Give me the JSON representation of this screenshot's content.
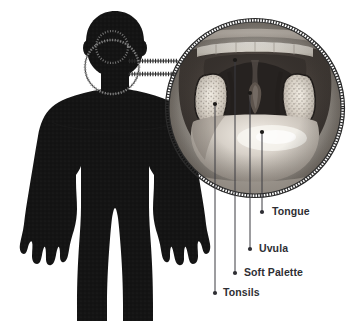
{
  "figure": {
    "body_silhouette": {
      "name": "human-body-silhouette",
      "color": "#141414",
      "description": "Front-facing dark silhouette of a human upper body, cropped at the thighs"
    },
    "magnifier": {
      "small_circle_name": "head-focus-circle",
      "large_circle_name": "magnified-throat-circle",
      "connector_name": "magnifier-connector-band",
      "border_style": "beaded-dashed",
      "border_color": "#2b2b2b"
    },
    "photo": {
      "name": "open-mouth-throat-photograph",
      "alt": "Photograph of an open mouth showing teeth, tonsils, uvula, soft palate and tongue",
      "palette": {
        "skin_light": "#cfc8c0",
        "skin_mid": "#a79d94",
        "cavity_dark": "#4b4440",
        "cavity_darkest": "#2a2623",
        "tongue_light": "#d8d2cb",
        "tongue_highlight": "#f2efe9",
        "teeth": "#ece8e0",
        "tonsil_light": "#e6e1d8"
      }
    },
    "callouts": [
      {
        "id": "tongue",
        "label": "Tongue",
        "marker_x": 262,
        "marker_y": 212,
        "anchor_x": 262,
        "anchor_y": 132,
        "label_x": 272,
        "label_y": 207
      },
      {
        "id": "uvula",
        "label": "Uvula",
        "marker_x": 250,
        "marker_y": 249,
        "anchor_x": 250,
        "anchor_y": 93,
        "label_x": 259,
        "label_y": 244
      },
      {
        "id": "soft-palette",
        "label": "Soft Palette",
        "marker_x": 235,
        "marker_y": 273,
        "anchor_x": 235,
        "anchor_y": 60,
        "label_x": 244,
        "label_y": 268
      },
      {
        "id": "tonsils",
        "label": "Tonsils",
        "marker_x": 215,
        "marker_y": 293,
        "anchor_x": 215,
        "anchor_y": 104,
        "label_x": 223,
        "label_y": 288
      }
    ],
    "leader_line": {
      "color": "#3b3b40",
      "width": 1,
      "marker_radius": 2.1,
      "marker_color": "#2e2e33"
    },
    "label_style": {
      "color": "#2e2e33",
      "font_size_px": 10.5,
      "font_weight": 600
    }
  }
}
